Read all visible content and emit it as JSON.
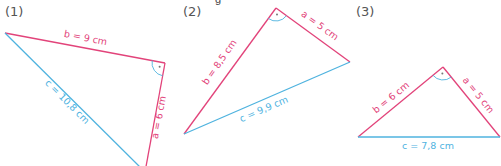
{
  "title_fragment": "g",
  "colors": {
    "leg": "#e2437a",
    "hypotenuse": "#4fb3df",
    "right_angle_mark": "#4fb3df"
  },
  "figures": [
    {
      "label": "(1)",
      "label_pos": [
        5,
        4
      ],
      "vertices": {
        "A": [
          5,
          33
        ],
        "C": [
          165,
          63
        ],
        "B": [
          145,
          172
        ]
      },
      "sides": [
        {
          "name": "b",
          "text": "b = 9 cm",
          "from": "A",
          "to": "C",
          "type": "leg",
          "tx": 85,
          "ty": 41,
          "rot": 11
        },
        {
          "name": "a",
          "text": "a = 6 cm",
          "from": "C",
          "to": "B",
          "type": "leg",
          "tx": 162,
          "ty": 118,
          "rot": -79
        },
        {
          "name": "c",
          "text": "c = 10,8 cm",
          "from": "A",
          "to": "B",
          "type": "hypotenuse",
          "tx": 65,
          "ty": 104,
          "rot": 45
        }
      ],
      "right_angle_at": "C"
    },
    {
      "label": "(2)",
      "label_pos": [
        183,
        4
      ],
      "vertices": {
        "C": [
          276,
          8
        ],
        "B": [
          350,
          62
        ],
        "A": [
          184,
          134
        ]
      },
      "sides": [
        {
          "name": "a",
          "text": "a = 5 cm",
          "from": "C",
          "to": "B",
          "type": "leg",
          "tx": 318,
          "ty": 28,
          "rot": 36
        },
        {
          "name": "b",
          "text": "b = 8,5 cm",
          "from": "C",
          "to": "A",
          "type": "leg",
          "tx": 222,
          "ty": 64,
          "rot": -55
        },
        {
          "name": "c",
          "text": "c = 9,9 cm",
          "from": "A",
          "to": "B",
          "type": "hypotenuse",
          "tx": 265,
          "ty": 112,
          "rot": -23
        }
      ],
      "right_angle_at": "C"
    },
    {
      "label": "(3)",
      "label_pos": [
        356,
        4
      ],
      "vertices": {
        "C": [
          443,
          67
        ],
        "B": [
          500,
          137
        ],
        "A": [
          358,
          137
        ]
      },
      "sides": [
        {
          "name": "a",
          "text": "a = 5 cm",
          "from": "C",
          "to": "B",
          "type": "leg",
          "tx": 476,
          "ty": 97,
          "rot": 51
        },
        {
          "name": "b",
          "text": "b = 6 cm",
          "from": "C",
          "to": "A",
          "type": "leg",
          "tx": 393,
          "ty": 100,
          "rot": -39
        },
        {
          "name": "c",
          "text": "c = 7,8 cm",
          "from": "A",
          "to": "B",
          "type": "hypotenuse",
          "tx": 428,
          "ty": 149,
          "rot": 0
        }
      ],
      "right_angle_at": "C"
    }
  ]
}
